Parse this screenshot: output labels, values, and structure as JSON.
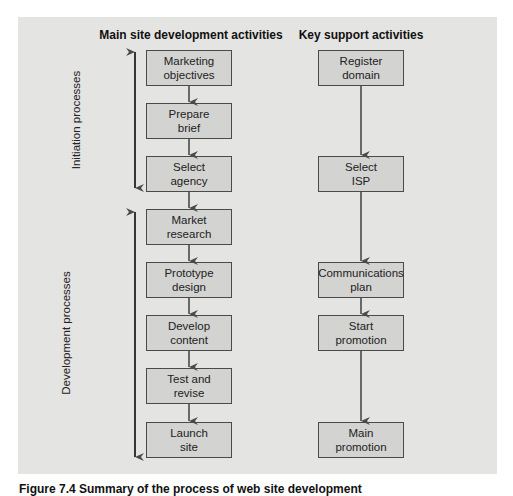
{
  "figure": {
    "caption": "Figure 7.4 Summary of the process of web site development"
  },
  "columns": {
    "main": {
      "title": "Main site development activities",
      "boxes": [
        {
          "label": "Marketing\nobjectives"
        },
        {
          "label": "Prepare\nbrief"
        },
        {
          "label": "Select\nagency"
        },
        {
          "label": "Market\nresearch"
        },
        {
          "label": "Prototype\ndesign"
        },
        {
          "label": "Develop\ncontent"
        },
        {
          "label": "Test and\nrevise"
        },
        {
          "label": "Launch\nsite"
        }
      ]
    },
    "support": {
      "title": "Key support activities",
      "boxes": [
        {
          "label": "Register\ndomain"
        },
        {
          "label": "Select\nISP"
        },
        {
          "label": "Communications\nplan"
        },
        {
          "label": "Start\npromotion"
        },
        {
          "label": "Main\npromotion"
        }
      ]
    }
  },
  "phases": [
    {
      "label": "Initiation processes"
    },
    {
      "label": "Development processes"
    }
  ],
  "colors": {
    "panel": "#e4e4e2",
    "box_fill": "#d3d3d1",
    "line": "#4a4a4a"
  }
}
